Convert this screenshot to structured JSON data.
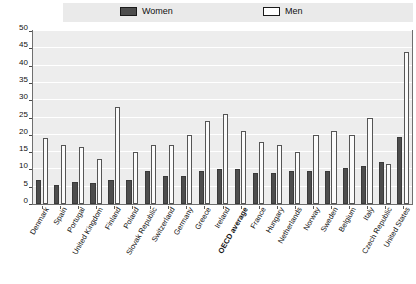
{
  "legend": {
    "items": [
      {
        "label": "Women",
        "style": "filled",
        "color": "#4d4d4d"
      },
      {
        "label": "Men",
        "style": "hollow",
        "color": "#ffffff"
      }
    ]
  },
  "axes": {
    "y_ticks": [
      "0",
      "5",
      "10",
      "15",
      "20",
      "25",
      "30",
      "35",
      "40",
      "45",
      "50"
    ],
    "y_min": 0,
    "y_max": 50,
    "y_step": 5
  },
  "chart_data": {
    "type": "bar",
    "title": "",
    "xlabel": "",
    "ylabel": "",
    "ylim": [
      0,
      50
    ],
    "grid": true,
    "legend_position": "top",
    "categories": [
      "Denmark",
      "Spain",
      "Portugal",
      "United Kingdom",
      "Finland",
      "Poland",
      "Slovak Republic",
      "Switzerland",
      "Germany",
      "Greece",
      "Ireland",
      "OECD average",
      "France",
      "Hungary",
      "Netherlands",
      "Norway",
      "Sweden",
      "Belgium",
      "Italy",
      "Czech Republic",
      "United States"
    ],
    "highlight_category": "OECD average",
    "series": [
      {
        "name": "Women",
        "color": "#4d4d4d",
        "values": [
          7.0,
          5.5,
          6.5,
          6.0,
          7.0,
          7.0,
          9.5,
          8.0,
          8.0,
          9.5,
          10.0,
          10.0,
          9.0,
          9.0,
          9.5,
          9.5,
          9.5,
          10.5,
          11.0,
          12.0,
          19.5
        ]
      },
      {
        "name": "Men",
        "color": "#ffffff",
        "values": [
          19.0,
          17.0,
          16.5,
          13.0,
          28.0,
          15.0,
          17.0,
          17.0,
          20.0,
          24.0,
          26.0,
          21.0,
          18.0,
          17.0,
          15.0,
          20.0,
          21.0,
          20.0,
          25.0,
          11.5,
          44.0
        ]
      }
    ]
  }
}
